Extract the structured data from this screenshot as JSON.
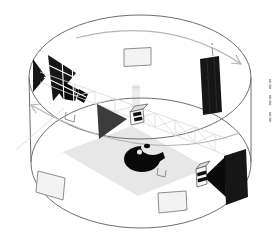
{
  "figure": {
    "kind": "axonometric-diagram",
    "parts": {
      "cylinder": "drum-pavilion-outline",
      "floor": "floor-plane",
      "structure": [
        "truss-beam",
        "center-column"
      ],
      "screens": [
        "ceiling-screen",
        "wall-screen-left",
        "wall-screen-bottom"
      ],
      "arrows": [
        "top-rim-rotation-arrow",
        "inner-floor-rotation-arrow"
      ],
      "exhibits": [
        "left-triangle-pair",
        "left-sculpture-blob",
        "center-triangle",
        "marked-model-cube",
        "crescent-sculpture",
        "upper-right-dark-panel",
        "lower-right-dark-panel",
        "lower-right-triangle",
        "striped-cube"
      ],
      "markers": [
        "bracket-marker-left",
        "bracket-marker-center"
      ],
      "annotations": "vertical-caption-marks"
    },
    "vertical_caption": {
      "legible": false,
      "mark_groups": 3
    }
  },
  "colors": {
    "background": "#ffffff",
    "outline": "#6e6e6e",
    "arrow": "#b5b5b5",
    "dark": "#161616",
    "darker": "#0a0a0a",
    "mid_gray": "#3c3c3c",
    "screen_fill": "#f3f3f3",
    "screen_stroke": "#8e8e8e",
    "floor": "#e7e7e7",
    "column_fill": "#ededed",
    "truss": "#d9d9d9",
    "truss_highlight": "#ffffff",
    "cube_face": "#f8f8f8",
    "cube_top": "#dedede",
    "cube_stroke": "#555555",
    "cube_mark": "#101010",
    "bracket": "#8f8f8f",
    "seam": "#2e2e2e",
    "tick": "#999999",
    "caption": "#b0b0b0"
  }
}
